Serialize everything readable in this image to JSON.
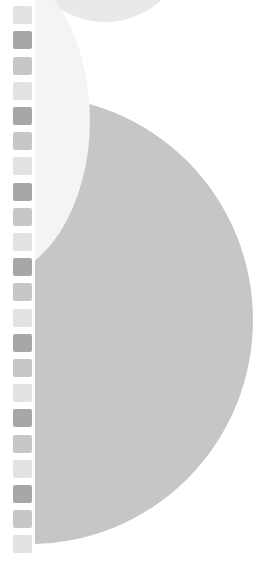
{
  "canvas": {
    "width": 273,
    "height": 568,
    "background": "#ffffff"
  },
  "colors": {
    "square_dark": "#a7a7a7",
    "square_medium": "#c7c7c7",
    "square_light": "#e2e2e2",
    "circle_top": "#e9e9e9",
    "pale_ellipse": "#f4f4f4",
    "gray_circle": "#c6c6c6"
  },
  "square_column": {
    "x": 13,
    "width": 19,
    "height": 18,
    "pitch": 25.2,
    "start_y": -19,
    "pattern": [
      "medium",
      "light",
      "dark"
    ],
    "count": 23
  },
  "shapes": [
    {
      "name": "top-light-circle",
      "cx": 105,
      "cy": -62,
      "rx": 84,
      "ry": 84,
      "color": "circle_top"
    },
    {
      "name": "large-gray-circle",
      "cx": 30,
      "cy": 320,
      "rx": 223,
      "ry": 224,
      "color": "gray_circle"
    },
    {
      "name": "pale-ellipse",
      "cx": -15,
      "cy": 120,
      "rx": 105,
      "ry": 160,
      "color": "pale_ellipse"
    }
  ]
}
